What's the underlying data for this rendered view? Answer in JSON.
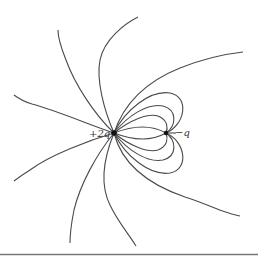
{
  "diagram": {
    "type": "electric-field-lines",
    "charges": [
      {
        "label": "+2q",
        "x": 114,
        "y": 133,
        "sign": "positive",
        "magnitude": 2
      },
      {
        "label": "−q",
        "x": 166,
        "y": 133,
        "sign": "negative",
        "magnitude": 1
      }
    ],
    "colors": {
      "line": "#4a4a4a",
      "charge": "#111111",
      "rule": "#777777"
    }
  }
}
